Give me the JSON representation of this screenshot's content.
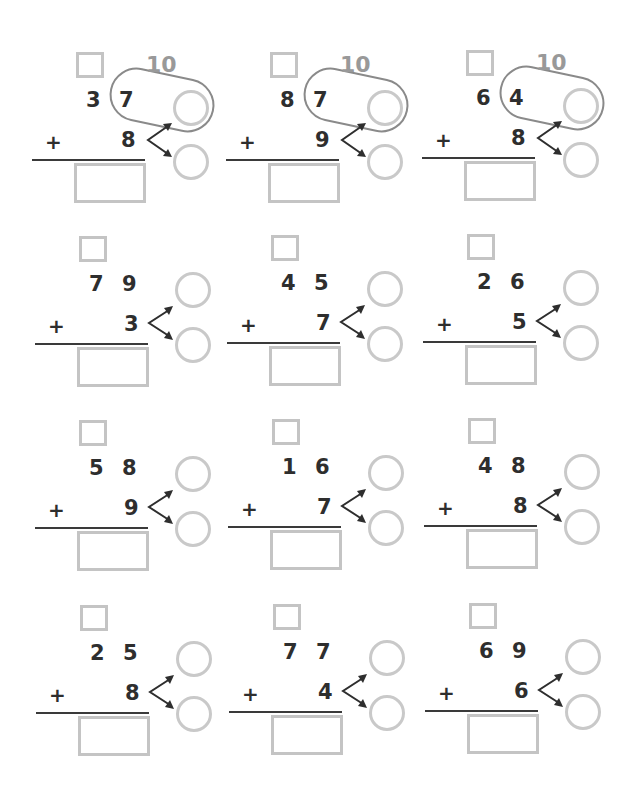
{
  "worksheet": {
    "type": "two-digit plus one-digit addition with bridging through ten",
    "ten_label": "10",
    "operator": "+",
    "colors": {
      "digits": "#2e2e2e",
      "boxes": "#c4c4c4",
      "circles": "#c9c9c9",
      "ten_label": "#999999",
      "pill_outline": "#8a8a8a",
      "arrows": "#2e2e2e",
      "rule": "#3a3a3a"
    },
    "problems": [
      {
        "tens": "3",
        "ones": "7",
        "addend": "8",
        "show_ten": true
      },
      {
        "tens": "8",
        "ones": "7",
        "addend": "9",
        "show_ten": true
      },
      {
        "tens": "6",
        "ones": "4",
        "addend": "8",
        "show_ten": true
      },
      {
        "tens": "7",
        "ones": "9",
        "addend": "3",
        "show_ten": false
      },
      {
        "tens": "4",
        "ones": "5",
        "addend": "7",
        "show_ten": false
      },
      {
        "tens": "2",
        "ones": "6",
        "addend": "5",
        "show_ten": false
      },
      {
        "tens": "5",
        "ones": "8",
        "addend": "9",
        "show_ten": false
      },
      {
        "tens": "1",
        "ones": "6",
        "addend": "7",
        "show_ten": false
      },
      {
        "tens": "4",
        "ones": "8",
        "addend": "8",
        "show_ten": false
      },
      {
        "tens": "2",
        "ones": "5",
        "addend": "8",
        "show_ten": false
      },
      {
        "tens": "7",
        "ones": "7",
        "addend": "4",
        "show_ten": false
      },
      {
        "tens": "6",
        "ones": "9",
        "addend": "6",
        "show_ten": false
      }
    ]
  }
}
